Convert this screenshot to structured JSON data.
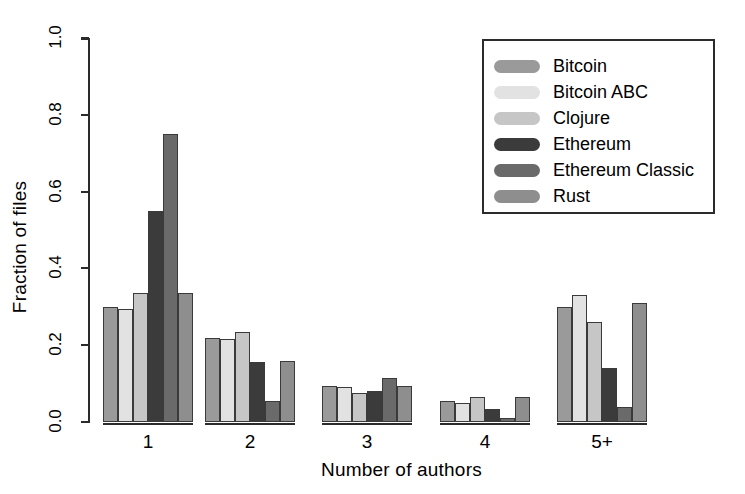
{
  "chart_data": {
    "type": "bar",
    "title": "",
    "xlabel": "Number of authors",
    "ylabel": "Fraction of files",
    "categories": [
      "1",
      "2",
      "3",
      "4",
      "5+"
    ],
    "ylim": [
      0.0,
      1.0
    ],
    "yticks": [
      0.0,
      0.2,
      0.4,
      0.6,
      0.8,
      1.0
    ],
    "ytick_labels": [
      "0.0",
      "0.2",
      "0.4",
      "0.6",
      "0.8",
      "1.0"
    ],
    "grid": false,
    "legend_position": "top-right",
    "series": [
      {
        "name": "Bitcoin",
        "color": "#9a9a9a",
        "values": [
          0.3,
          0.22,
          0.095,
          0.055,
          0.3
        ]
      },
      {
        "name": "Bitcoin ABC",
        "color": "#e2e2e2",
        "values": [
          0.295,
          0.215,
          0.09,
          0.05,
          0.33
        ]
      },
      {
        "name": "Clojure",
        "color": "#c6c6c6",
        "values": [
          0.335,
          0.235,
          0.075,
          0.065,
          0.26
        ]
      },
      {
        "name": "Ethereum",
        "color": "#3b3b3b",
        "values": [
          0.55,
          0.155,
          0.08,
          0.035,
          0.14
        ]
      },
      {
        "name": "Ethereum Classic",
        "color": "#6a6a6a",
        "values": [
          0.75,
          0.055,
          0.115,
          0.01,
          0.04
        ]
      },
      {
        "name": "Rust",
        "color": "#8e8e8e",
        "values": [
          0.335,
          0.16,
          0.095,
          0.065,
          0.31
        ]
      }
    ]
  },
  "legend": {
    "entries": [
      {
        "label": "Bitcoin"
      },
      {
        "label": "Bitcoin ABC"
      },
      {
        "label": "Clojure"
      },
      {
        "label": "Ethereum"
      },
      {
        "label": "Ethereum Classic"
      },
      {
        "label": "Rust"
      }
    ]
  },
  "axes": {
    "y_title": "Fraction of files",
    "x_title": "Number of authors"
  }
}
